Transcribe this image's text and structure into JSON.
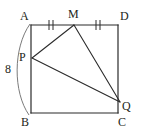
{
  "figure": {
    "name": "square-with-inscribed-triangle",
    "stroke_color": "#2b2b2b",
    "arc_color": "#6b6b6b",
    "background_color": "#ffffff",
    "labels": {
      "A": "A",
      "B": "B",
      "C": "C",
      "D": "D",
      "M": "M",
      "P": "P",
      "Q": "Q"
    },
    "measures": {
      "side_AB": "8"
    },
    "tick_marks": {
      "segment_AM": "||",
      "segment_MD": "||",
      "count": 2
    },
    "points": {
      "A": {
        "x": 31,
        "y": 25
      },
      "D": {
        "x": 118,
        "y": 25
      },
      "B": {
        "x": 31,
        "y": 113
      },
      "C": {
        "x": 118,
        "y": 113
      },
      "M": {
        "x": 74,
        "y": 25
      },
      "P": {
        "x": 32,
        "y": 58
      },
      "Q": {
        "x": 120,
        "y": 102
      }
    },
    "segments": [
      {
        "name": "AD",
        "from": "A",
        "to": "D"
      },
      {
        "name": "DC",
        "from": "D",
        "to": "C"
      },
      {
        "name": "CB",
        "from": "C",
        "to": "B"
      },
      {
        "name": "BA",
        "from": "B",
        "to": "A"
      },
      {
        "name": "MP",
        "from": "M",
        "to": "P"
      },
      {
        "name": "PQ",
        "from": "P",
        "to": "Q"
      },
      {
        "name": "MQ",
        "from": "M",
        "to": "Q"
      }
    ],
    "arc": {
      "name": "side-length-brace-AB",
      "from": "A",
      "to": "B",
      "label": "8"
    }
  }
}
